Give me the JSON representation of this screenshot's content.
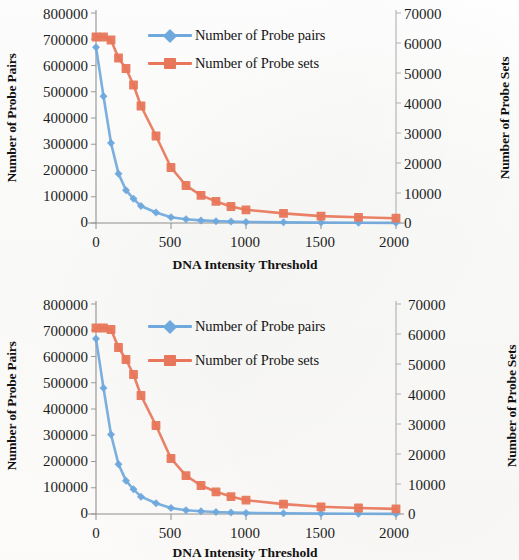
{
  "figures": [
    {
      "id": "top",
      "xlabel": "DNA Intensity Threshold",
      "ylabel_left": "Number of Probe Pairs",
      "ylabel_right": "Number of Probe Sets",
      "legend": [
        {
          "label": "Number of Probe pairs",
          "marker": "diamond",
          "color": "#6FA8DC"
        },
        {
          "label": "Number of Probe sets",
          "marker": "square",
          "color": "#E8765A"
        }
      ],
      "yticks_left": [
        "800000",
        "700000",
        "600000",
        "500000",
        "400000",
        "300000",
        "200000",
        "100000",
        "0"
      ],
      "yticks_right": [
        "70000",
        "60000",
        "50000",
        "40000",
        "30000",
        "20000",
        "10000",
        "0"
      ],
      "xticks": [
        "0",
        "500",
        "1000",
        "1500",
        "2000"
      ]
    },
    {
      "id": "bottom",
      "xlabel": "DNA Intensity Threshold",
      "ylabel_left": "Number of Probe Pairs",
      "ylabel_right": "Number of Probe Sets",
      "legend": [
        {
          "label": "Number of Probe pairs",
          "marker": "diamond",
          "color": "#6FA8DC"
        },
        {
          "label": "Number of Probe sets",
          "marker": "square",
          "color": "#E8765A"
        }
      ],
      "yticks_left": [
        "800000",
        "700000",
        "600000",
        "500000",
        "400000",
        "300000",
        "200000",
        "100000",
        "0"
      ],
      "yticks_right": [
        "70000",
        "60000",
        "50000",
        "40000",
        "30000",
        "20000",
        "10000",
        "0"
      ],
      "xticks": [
        "0",
        "500",
        "1000",
        "1500",
        "2000"
      ]
    }
  ],
  "chart_data": [
    {
      "type": "line",
      "title": "",
      "xlabel": "DNA Intensity Threshold",
      "ylabel": "Number of Probe Pairs",
      "ylabel_secondary": "Number of Probe Sets",
      "xlim": [
        0,
        2000
      ],
      "ylim": [
        0,
        800000
      ],
      "ylim_secondary": [
        0,
        70000
      ],
      "xticks": [
        0,
        500,
        1000,
        1500,
        2000
      ],
      "yticks": [
        0,
        100000,
        200000,
        300000,
        400000,
        500000,
        600000,
        700000,
        800000
      ],
      "yticks_secondary": [
        0,
        10000,
        20000,
        30000,
        40000,
        50000,
        60000,
        70000
      ],
      "grid": false,
      "legend_position": "upper-center",
      "series": [
        {
          "name": "Number of Probe pairs",
          "axis": "left",
          "color": "#6FA8DC",
          "marker": "diamond",
          "x": [
            0,
            50,
            100,
            150,
            200,
            250,
            300,
            400,
            500,
            600,
            700,
            800,
            900,
            1000,
            1250,
            1500,
            1750,
            2000
          ],
          "values": [
            670000,
            483000,
            305000,
            188000,
            125000,
            92000,
            65000,
            40000,
            22000,
            14000,
            10000,
            7000,
            5500,
            4000,
            2500,
            1500,
            900,
            500
          ]
        },
        {
          "name": "Number of Probe sets",
          "axis": "right",
          "color": "#E8765A",
          "marker": "square",
          "x": [
            0,
            50,
            100,
            150,
            200,
            250,
            300,
            400,
            500,
            600,
            700,
            800,
            900,
            1000,
            1250,
            1500,
            1750,
            2000
          ],
          "values": [
            62000,
            62000,
            61000,
            55000,
            51500,
            46000,
            39000,
            29000,
            18500,
            12500,
            9200,
            7200,
            5500,
            4400,
            3200,
            2300,
            1900,
            1600
          ]
        }
      ]
    },
    {
      "type": "line",
      "title": "",
      "xlabel": "DNA Intensity Threshold",
      "ylabel": "Number of Probe Pairs",
      "ylabel_secondary": "Number of Probe Sets",
      "xlim": [
        0,
        2000
      ],
      "ylim": [
        0,
        800000
      ],
      "ylim_secondary": [
        0,
        70000
      ],
      "xticks": [
        0,
        500,
        1000,
        1500,
        2000
      ],
      "yticks": [
        0,
        100000,
        200000,
        300000,
        400000,
        500000,
        600000,
        700000,
        800000
      ],
      "yticks_secondary": [
        0,
        10000,
        20000,
        30000,
        40000,
        50000,
        60000,
        70000
      ],
      "grid": false,
      "legend_position": "upper-center",
      "series": [
        {
          "name": "Number of Probe pairs",
          "axis": "left",
          "color": "#6FA8DC",
          "marker": "diamond",
          "x": [
            0,
            50,
            100,
            150,
            200,
            250,
            300,
            400,
            500,
            600,
            700,
            800,
            900,
            1000,
            1250,
            1500,
            1750,
            2000
          ],
          "values": [
            668000,
            480000,
            303000,
            190000,
            127000,
            94000,
            66000,
            41000,
            23000,
            14500,
            10500,
            7500,
            6000,
            4200,
            2600,
            1600,
            950,
            520
          ]
        },
        {
          "name": "Number of Probe sets",
          "axis": "right",
          "color": "#E8765A",
          "marker": "square",
          "x": [
            0,
            50,
            100,
            150,
            200,
            250,
            300,
            400,
            500,
            600,
            700,
            800,
            900,
            1000,
            1250,
            1500,
            1750,
            2000
          ],
          "values": [
            62000,
            62000,
            61500,
            55500,
            51500,
            46500,
            39500,
            29500,
            18500,
            12800,
            9500,
            7400,
            5800,
            4600,
            3300,
            2400,
            2000,
            1700
          ]
        }
      ]
    }
  ]
}
